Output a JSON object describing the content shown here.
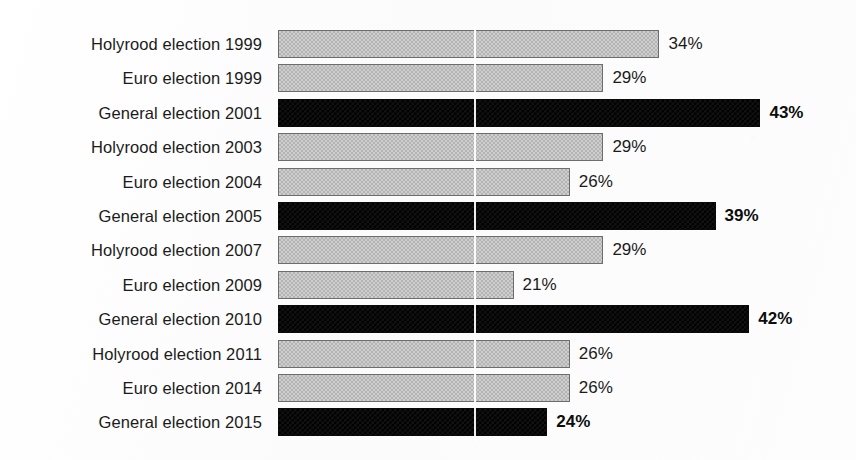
{
  "chart_data": {
    "type": "bar",
    "orientation": "horizontal",
    "title": "",
    "subtitle": "",
    "xlabel": "",
    "ylabel": "",
    "xlim": [
      0,
      50
    ],
    "grid": true,
    "gridlines_x": [
      17.5
    ],
    "legend": [],
    "legend_position": "none",
    "value_suffix": "%",
    "categories": [
      "Holyrood election 1999",
      "Euro election 1999",
      "General election 2001",
      "Holyrood election 2003",
      "Euro election 2004",
      "General election 2005",
      "Holyrood election 2007",
      "Euro election 2009",
      "General election 2010",
      "Holyrood election 2011",
      "Euro election 2014",
      "General election 2015"
    ],
    "values": [
      34,
      29,
      43,
      29,
      26,
      39,
      29,
      21,
      42,
      26,
      26,
      24
    ],
    "value_labels": [
      "34%",
      "29%",
      "43%",
      "29%",
      "26%",
      "39%",
      "29%",
      "21%",
      "42%",
      "26%",
      "26%",
      "24%"
    ],
    "series_of_bar": [
      "other",
      "other",
      "general",
      "other",
      "other",
      "general",
      "other",
      "other",
      "general",
      "other",
      "other",
      "general"
    ]
  },
  "colors": {
    "general_election_bar": "#111111",
    "other_election_bar": "#cfcfcf",
    "other_election_bar_border": "#6d6d6d",
    "background": "#fdfdfd",
    "text": "#1b1b1b",
    "gridline": "#ffffff"
  }
}
